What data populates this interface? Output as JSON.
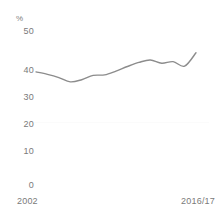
{
  "chart_data": {
    "type": "line",
    "title": "",
    "subtitle": "",
    "xlabel": "",
    "ylabel": "%",
    "unit_label": "%",
    "ylim": [
      0,
      50
    ],
    "yticks": [
      50,
      40,
      30,
      20,
      10,
      0
    ],
    "ytick_labels": [
      "50",
      "40",
      "30",
      "20",
      "10",
      "0"
    ],
    "xlim_labels": [
      "2002",
      "2016/17"
    ],
    "xticks": [
      "2002",
      "2016/17"
    ],
    "grid": false,
    "legend": null,
    "legend_position": "none",
    "line_color": "#8c8c8c",
    "series": [
      {
        "name": "",
        "x": [
          "2002",
          "2003",
          "2004",
          "2005",
          "2006",
          "2007",
          "2008",
          "2009",
          "2010",
          "2011",
          "2012",
          "2013",
          "2014",
          "2015",
          "2016/17"
        ],
        "values": [
          39.3,
          38.4,
          37.2,
          35.6,
          36.4,
          38.0,
          38.2,
          39.6,
          41.3,
          42.8,
          43.7,
          42.5,
          43.1,
          41.4,
          46.4
        ]
      }
    ],
    "annotations": []
  },
  "axis": {
    "unit": "%",
    "y_labels": {
      "t50": "50",
      "t40": "40",
      "t30": "30",
      "t20": "20",
      "t10": "10",
      "t0": "0"
    },
    "x_labels": {
      "start": "2002",
      "end": "2016/17"
    }
  }
}
